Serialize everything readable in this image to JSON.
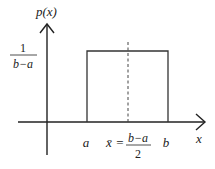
{
  "diagram": {
    "type": "uniform-distribution-pdf",
    "y_axis_label": "p(x)",
    "x_axis_label": "x",
    "height_label": {
      "numerator": "1",
      "denominator": "b−a"
    },
    "x_ticks": {
      "a": "a",
      "b": "b",
      "mean_symbol": "x̄",
      "mean_equals": "=",
      "mean_numerator": "b−a",
      "mean_denominator": "2"
    },
    "colors": {
      "axis": "#222222",
      "rectangle": "#333333",
      "dashed_line": "#444444",
      "background": "#ffffff"
    }
  }
}
